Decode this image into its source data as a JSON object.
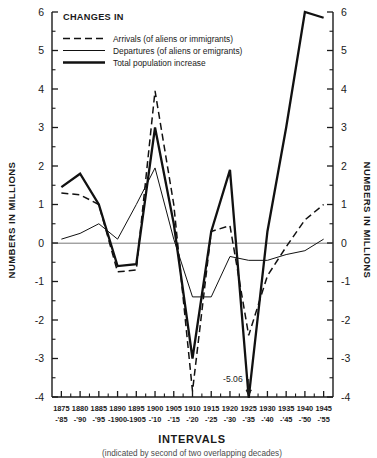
{
  "chart_data": {
    "type": "line",
    "title": "",
    "legend_title": "CHANGES IN",
    "legend_position": "top-left-inside",
    "grid": false,
    "xlabel": "INTERVALS",
    "xlabel_note": "(indicated by second of two overlapping decades)",
    "ylabel": "NUMBERS IN MILLIONS",
    "ylabel_right": "NUMBERS IN MILLIONS",
    "ylim": [
      -4,
      6
    ],
    "ytick_step": 1,
    "yminor_step": 0.5,
    "yticks": [
      -4,
      -3,
      -2,
      -1,
      0,
      1,
      2,
      3,
      4,
      5,
      6
    ],
    "ytick_labels": [
      "-4",
      "-3",
      "-2",
      "-1",
      "0",
      "1",
      "2",
      "3",
      "4",
      "5",
      "6"
    ],
    "categories": [
      "1875-'85",
      "1880-'90",
      "1885-'95",
      "1890-1900",
      "1895-1905",
      "1900-'10",
      "1905-'15",
      "1910-'20",
      "1915-'25",
      "1920-'30",
      "1925-'35",
      "1930-'40",
      "1935-'45",
      "1940-'50",
      "1945-'55"
    ],
    "xtick_top": [
      "1875",
      "1880",
      "1885",
      "1890",
      "1895",
      "1900",
      "1905",
      "1910",
      "1915",
      "1920",
      "1925",
      "1930",
      "1935",
      "1940",
      "1945"
    ],
    "xtick_bottom": [
      "-'85",
      "-'90",
      "-'95",
      "-1900",
      "-1905",
      "-'10",
      "-'15",
      "-'20",
      "-'25",
      "-'30",
      "-'35",
      "-'40",
      "-'45",
      "-'50",
      "-'55"
    ],
    "series": [
      {
        "name": "Arrivals (of aliens or immigrants)",
        "style": "dashed",
        "values": [
          1.3,
          1.25,
          1.0,
          -0.75,
          -0.7,
          3.95,
          1.0,
          -3.85,
          0.3,
          0.45,
          -2.4,
          -0.85,
          -0.1,
          0.6,
          1.0
        ]
      },
      {
        "name": "Departures (of aliens or emigrants)",
        "style": "thin-solid",
        "values": [
          0.1,
          0.25,
          0.5,
          0.1,
          1.0,
          1.95,
          0.1,
          -1.4,
          -1.4,
          -0.35,
          -0.45,
          -0.45,
          -0.3,
          -0.2,
          0.1
        ]
      },
      {
        "name": "Total population increase",
        "style": "thick-solid",
        "values": [
          1.45,
          1.8,
          1.0,
          -0.6,
          -0.55,
          3.0,
          0.5,
          -3.0,
          0.3,
          1.9,
          -5.06,
          0.3,
          3.0,
          6.0,
          5.85
        ]
      }
    ],
    "annotations": [
      {
        "text": "-5.06",
        "category": "1925-'35",
        "value": -5.06,
        "note": "off-scale value marked with arrow below axis"
      }
    ]
  }
}
